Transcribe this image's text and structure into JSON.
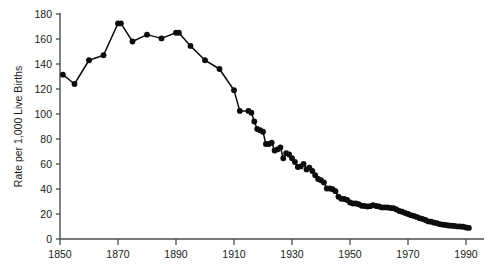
{
  "chart_data": {
    "type": "line",
    "title": "",
    "subtitle": "",
    "xlabel": "",
    "ylabel": "Rate per 1,000 Live Births",
    "xlim": [
      1846,
      1994
    ],
    "ylim": [
      0,
      180
    ],
    "grid": false,
    "legend": null,
    "legend_position": "none",
    "series_color": "#0d0d0d",
    "marker": "filled-circle",
    "x_ticks": [
      1850,
      1870,
      1890,
      1910,
      1930,
      1950,
      1970,
      1990
    ],
    "x_tick_labels": [
      "1850",
      "1870",
      "1890",
      "1910",
      "1930",
      "1950",
      "1970",
      "1990"
    ],
    "y_ticks": [
      0,
      20,
      40,
      60,
      80,
      100,
      120,
      140,
      160,
      180
    ],
    "y_tick_labels": [
      "0",
      "20",
      "40",
      "60",
      "80",
      "100",
      "120",
      "140",
      "160",
      "180"
    ],
    "series": [
      {
        "name": "Infant mortality rate",
        "x": [
          1851,
          1855,
          1860,
          1865,
          1870,
          1871,
          1875,
          1880,
          1885,
          1890,
          1891,
          1895,
          1900,
          1905,
          1910,
          1912,
          1915,
          1916,
          1917,
          1918,
          1919,
          1920,
          1921,
          1922,
          1923,
          1924,
          1925,
          1926,
          1927,
          1928,
          1929,
          1930,
          1931,
          1932,
          1933,
          1934,
          1935,
          1936,
          1937,
          1938,
          1939,
          1940,
          1941,
          1942,
          1943,
          1944,
          1945,
          1946,
          1947,
          1948,
          1949,
          1950,
          1951,
          1952,
          1953,
          1954,
          1955,
          1956,
          1957,
          1958,
          1959,
          1960,
          1961,
          1962,
          1963,
          1964,
          1965,
          1966,
          1967,
          1968,
          1969,
          1970,
          1971,
          1972,
          1973,
          1974,
          1975,
          1976,
          1977,
          1978,
          1979,
          1980,
          1981,
          1982,
          1983,
          1984,
          1985,
          1986,
          1987,
          1988,
          1989,
          1990,
          1991
        ],
        "values": [
          131.5,
          124.0,
          143.0,
          147.0,
          172.5,
          172.5,
          158.0,
          163.5,
          160.5,
          165.0,
          165.0,
          154.5,
          143.0,
          136.0,
          119.0,
          102.5,
          102.5,
          101.0,
          94.0,
          88.0,
          87.0,
          85.8,
          76.0,
          76.0,
          77.1,
          70.8,
          71.7,
          73.3,
          64.6,
          68.7,
          67.6,
          64.6,
          61.6,
          57.6,
          58.1,
          60.1,
          55.7,
          57.1,
          54.4,
          51.0,
          48.0,
          47.0,
          45.3,
          40.4,
          40.4,
          39.8,
          38.3,
          33.8,
          32.2,
          32.0,
          31.3,
          29.2,
          28.4,
          28.4,
          27.8,
          26.6,
          26.4,
          26.0,
          26.3,
          27.1,
          26.4,
          26.0,
          25.3,
          25.3,
          25.2,
          24.8,
          24.7,
          23.7,
          22.4,
          21.8,
          20.9,
          20.0,
          19.1,
          18.5,
          17.7,
          16.7,
          16.1,
          15.2,
          14.1,
          13.8,
          13.1,
          12.6,
          11.9,
          11.5,
          11.2,
          10.8,
          10.6,
          10.4,
          10.1,
          10.0,
          9.8,
          9.2,
          8.9
        ]
      }
    ]
  }
}
